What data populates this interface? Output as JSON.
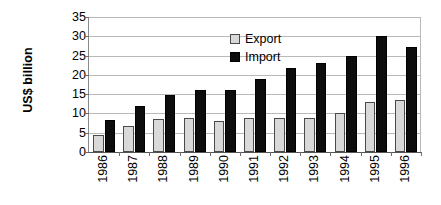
{
  "chart_data": {
    "type": "bar",
    "title": "",
    "subtitle": "",
    "xlabel": "",
    "ylabel": "US$ billion",
    "ylim": [
      0,
      35
    ],
    "ytick_step": 5,
    "yticks": [
      35,
      30,
      25,
      20,
      15,
      10,
      5,
      0
    ],
    "grid": true,
    "legend_position": "inside-top-left",
    "orientation": "vertical",
    "grouping": "clustered",
    "xtick_rotation": 90,
    "categories": [
      "1986",
      "1987",
      "1988",
      "1989",
      "1990",
      "1991",
      "1992",
      "1993",
      "1994",
      "1995",
      "1996"
    ],
    "series": [
      {
        "name": "Export",
        "color": "#d9d9d9",
        "values": [
          4.5,
          6.8,
          8.6,
          8.9,
          8.1,
          8.9,
          8.8,
          8.7,
          10.0,
          12.9,
          13.4
        ]
      },
      {
        "name": "Import",
        "color": "#0d0d0d",
        "values": [
          8.3,
          11.9,
          14.9,
          16.1,
          16.1,
          18.9,
          21.8,
          23.2,
          24.8,
          30.2,
          27.3
        ]
      }
    ]
  },
  "axis": {
    "y_title": "US$ billion",
    "y_tick_labels": [
      "35",
      "30",
      "25",
      "20",
      "15",
      "10",
      "5",
      "0"
    ],
    "x_tick_labels": [
      "1986",
      "1987",
      "1988",
      "1989",
      "1990",
      "1991",
      "1992",
      "1993",
      "1994",
      "1995",
      "1996"
    ]
  },
  "legend": {
    "items": [
      {
        "label": "Export",
        "swatch": "legend-swatch-export"
      },
      {
        "label": "Import",
        "swatch": "legend-swatch-import"
      }
    ]
  },
  "colors": {
    "export_fill": "#d9d9d9",
    "import_fill": "#0d0d0d",
    "gridline": "#b9b9b9",
    "axis": "#555555",
    "background": "#ffffff",
    "text": "#000000"
  }
}
